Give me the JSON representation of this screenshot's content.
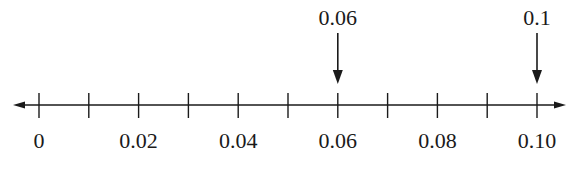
{
  "number_line": {
    "min": 0,
    "max": 0.1,
    "tick_step": 0.01,
    "ticks": [
      0,
      0.01,
      0.02,
      0.03,
      0.04,
      0.05,
      0.06,
      0.07,
      0.08,
      0.09,
      0.1
    ],
    "labels": [
      {
        "value": 0,
        "text": "0"
      },
      {
        "value": 0.02,
        "text": "0.02"
      },
      {
        "value": 0.04,
        "text": "0.04"
      },
      {
        "value": 0.06,
        "text": "0.06"
      },
      {
        "value": 0.08,
        "text": "0.08"
      },
      {
        "value": 0.1,
        "text": "0.10"
      }
    ],
    "markers": [
      {
        "value": 0.06,
        "text": "0.06"
      },
      {
        "value": 0.1,
        "text": "0.1"
      }
    ],
    "line_color": "#1a1a1a"
  }
}
